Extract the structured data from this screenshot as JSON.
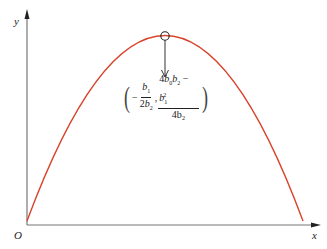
{
  "diagram": {
    "type": "parabola-vertex",
    "axes": {
      "x_label": "x",
      "y_label": "y",
      "origin_label": "O"
    },
    "curve": {
      "color": "#d9432b",
      "shape": "downward-opening parabola"
    },
    "vertex_marker": {
      "shape": "circle",
      "color": "#222222"
    },
    "annotation": {
      "minus_sign": "−",
      "x_coord": {
        "numerator": "b",
        "numerator_sub": "1",
        "denominator_coef": "2",
        "denominator": "b",
        "denominator_sub": "2"
      },
      "separator": ",",
      "y_coord": {
        "numerator_parts": [
          "4",
          "b",
          "0",
          "b",
          "2",
          "−",
          "b",
          "1",
          "2"
        ],
        "numerator_text": "4b₀b₂ − b₁²",
        "denominator_text": "4b₂"
      },
      "text": "(−b₁/(2b₂), (4b₀b₂ − b₁²)/(4b₂))"
    }
  }
}
